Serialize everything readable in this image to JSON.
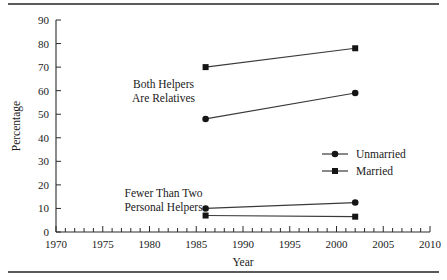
{
  "chart_data": {
    "type": "line",
    "title": "",
    "xlabel": "Year",
    "ylabel": "Percentage",
    "xlim": [
      1970,
      2010
    ],
    "ylim": [
      0,
      90
    ],
    "xticks": [
      1970,
      1975,
      1980,
      1985,
      1990,
      1995,
      2000,
      2005,
      2010
    ],
    "xtick_labels": [
      "1970",
      "1975",
      "1980",
      "1985",
      "1990",
      "1995",
      "2000",
      "2005",
      "2010"
    ],
    "x_minor_tick_step": 1,
    "yticks": [
      0,
      10,
      20,
      30,
      40,
      50,
      60,
      70,
      80,
      90
    ],
    "ytick_labels": [
      "0",
      "10",
      "20",
      "30",
      "40",
      "50",
      "60",
      "70",
      "80",
      "90"
    ],
    "grid": false,
    "legend_position": "right-middle",
    "x": [
      1986,
      2002
    ],
    "series": [
      {
        "name": "Married",
        "group": "Both Helpers Are Relatives",
        "marker": "square",
        "values": [
          70,
          78
        ]
      },
      {
        "name": "Unmarried",
        "group": "Both Helpers Are Relatives",
        "marker": "circle",
        "values": [
          48,
          59
        ]
      },
      {
        "name": "Unmarried",
        "group": "Fewer Than Two Personal Helpers",
        "marker": "circle",
        "values": [
          10,
          12.5
        ]
      },
      {
        "name": "Married",
        "group": "Fewer Than Two Personal Helpers",
        "marker": "square",
        "values": [
          7,
          6.5
        ]
      }
    ],
    "annotations": [
      {
        "id": "both-helpers",
        "lines": [
          "Both Helpers",
          "Are Relatives"
        ],
        "x": 1981.5,
        "y": 61
      },
      {
        "id": "fewer-than-two",
        "lines": [
          "Fewer Than Two",
          "Personal Helpers"
        ],
        "x": 1981.5,
        "y": 15
      }
    ]
  },
  "axes": {
    "ylabel": "Percentage",
    "xlabel": "Year"
  },
  "legend": {
    "entries": [
      {
        "label": "Unmarried",
        "marker": "circle"
      },
      {
        "label": "Married",
        "marker": "square"
      }
    ]
  },
  "colors": {
    "line": "#3a3a3a",
    "marker": "#151515",
    "axis": "#2b2b2b",
    "rule": "#5a5a5a",
    "text": "#1a1a1a",
    "background": "#ffffff"
  }
}
